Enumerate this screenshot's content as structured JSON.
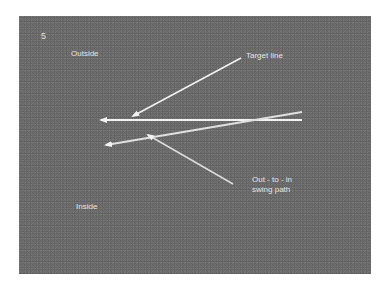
{
  "figure": {
    "number": "5",
    "labels": {
      "outside": "Outside",
      "inside": "Inside",
      "target_line": "Target line",
      "swing_path_line1": "Out - to - in",
      "swing_path_line2": "swing path"
    },
    "colors": {
      "background": "#6f6f6f",
      "line": "#f2f2f2",
      "label": "#e4e4e4"
    }
  }
}
